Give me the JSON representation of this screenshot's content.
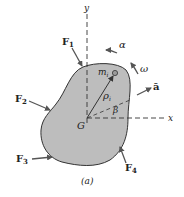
{
  "figure": {
    "caption": "(a)",
    "colors": {
      "body_fill": "#bdbdbd",
      "outline": "#333333",
      "arrow": "#555555",
      "text": "#222222"
    },
    "axes": {
      "x_label": "x",
      "y_label": "y"
    },
    "center_of_mass": {
      "label": "G"
    },
    "particle": {
      "label_main": "m",
      "label_sub": "i"
    },
    "position_vector": {
      "label_main": "ρ",
      "label_sub": "i"
    },
    "angle": {
      "label": "β"
    },
    "angular_acceleration": {
      "label": "α"
    },
    "angular_velocity": {
      "label": "ω"
    },
    "acceleration": {
      "label": "ā"
    },
    "forces": [
      {
        "label_main": "F",
        "label_sub": "1"
      },
      {
        "label_main": "F",
        "label_sub": "2"
      },
      {
        "label_main": "F",
        "label_sub": "3"
      },
      {
        "label_main": "F",
        "label_sub": "4"
      }
    ]
  }
}
